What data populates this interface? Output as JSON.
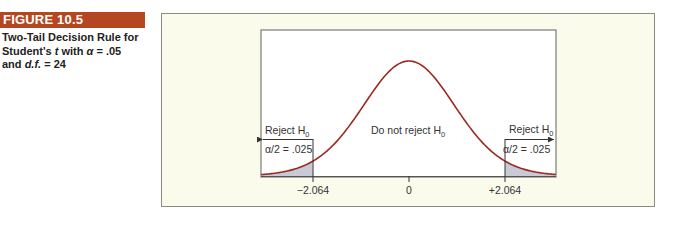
{
  "figure": {
    "badge": "FIGURE 10.5",
    "caption_line1": "Two-Tail Decision Rule for",
    "caption_line2_prefix": "Student's ",
    "caption_line2_t": "t",
    "caption_line2_mid": " with ",
    "caption_line2_alpha": "α",
    "caption_line2_suffix": " = .05",
    "caption_line3_prefix": "and ",
    "caption_line3_df": "d.f.",
    "caption_line3_suffix": " = 24"
  },
  "labels": {
    "reject_left": "Reject H",
    "reject_right": "Reject H",
    "do_not_reject": "Do not reject H",
    "h_sub": "0",
    "alpha_left": "α/2 = .025",
    "alpha_right": "α/2 = .025",
    "tick_left": "−2.064",
    "tick_center": "0",
    "tick_right": "+2.064"
  },
  "colors": {
    "badge": "#b4471f",
    "curve": "#9b2a1f",
    "tail_shade": "#c8cad6",
    "panel_bg": "#fbfbeb"
  },
  "chart_data": {
    "type": "area",
    "title": "Two-Tail Decision Rule for Student's t with α = .05 and d.f. = 24",
    "distribution": "Student's t",
    "df": 24,
    "alpha": 0.05,
    "critical_values": [
      -2.064,
      2.064
    ],
    "tail_area_each": 0.025,
    "x_ticks": [
      -2.064,
      0,
      2.064
    ],
    "x_tick_labels": [
      "−2.064",
      "0",
      "+2.064"
    ],
    "xlim": [
      -3.18,
      3.17
    ],
    "regions": [
      {
        "name": "Reject H0",
        "range": [
          -3.18,
          -2.064
        ],
        "shaded": true,
        "label": "α/2 = .025"
      },
      {
        "name": "Do not reject H0",
        "range": [
          -2.064,
          2.064
        ],
        "shaded": false
      },
      {
        "name": "Reject H0",
        "range": [
          2.064,
          3.17
        ],
        "shaded": true,
        "label": "α/2 = .025"
      }
    ],
    "grid": false,
    "legend": "none"
  }
}
